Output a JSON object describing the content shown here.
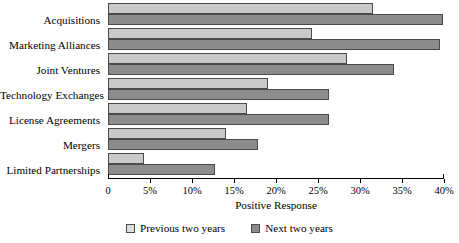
{
  "chart_data": {
    "type": "bar",
    "orientation": "horizontal",
    "title": "",
    "xlabel": "Positive Response",
    "ylabel": "",
    "xlim": [
      0,
      40
    ],
    "grid": false,
    "legend_position": "bottom",
    "tick_labels": [
      "0",
      "5%",
      "10%",
      "15%",
      "20%",
      "25%",
      "30%",
      "35%",
      "40%"
    ],
    "tick_values": [
      0,
      5,
      10,
      15,
      20,
      25,
      30,
      35,
      40
    ],
    "categories": [
      "Acquisitions",
      "Marketing Alliances",
      "Joint Ventures",
      "Technology Exchanges",
      "License Agreements",
      "Mergers",
      "Limited Partnerships"
    ],
    "series": [
      {
        "name": "Previous two years",
        "color": "#c9c9c9",
        "values": [
          31.6,
          24.3,
          28.4,
          19.0,
          16.6,
          14.1,
          4.3
        ]
      },
      {
        "name": "Next two years",
        "color": "#8c8c8c",
        "values": [
          39.9,
          39.5,
          34.0,
          26.3,
          26.3,
          17.8,
          12.7
        ]
      }
    ]
  },
  "legend": {
    "items": [
      {
        "label": "Previous two years",
        "swatch": "prev"
      },
      {
        "label": "Next two years",
        "swatch": "next"
      }
    ]
  }
}
